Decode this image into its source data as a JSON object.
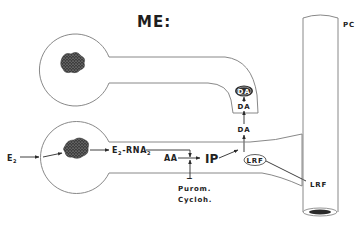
{
  "diagram": {
    "title": "ME:",
    "labels": {
      "pc": "PC",
      "da_vesicle": "DA",
      "da_mid": "DA",
      "da_lower": "DA",
      "e2": "E",
      "e2_sub": "2",
      "e2_rna_prefix": "E",
      "e2_rna_sub1": "2",
      "e2_rna_mid": "-RNA",
      "e2_rna_sub2": "2",
      "aa": "AA",
      "ip": "IP",
      "lrf_vesicle": "LRF",
      "lrf_out": "LRF",
      "inhibition_sign": "−",
      "purom": "Purom.",
      "cycloh": "Cycloh."
    },
    "colors": {
      "outline": "#7a7a7a",
      "ink": "#2a2a2a",
      "nucleus": "#4a4a4a",
      "vesicle_fill": "#2e2e2e"
    }
  }
}
